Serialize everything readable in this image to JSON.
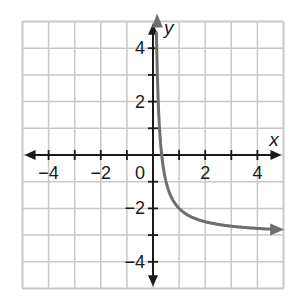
{
  "chart_data": {
    "type": "line",
    "title": "",
    "xlabel": "x",
    "ylabel": "y",
    "xlim": [
      -5,
      5
    ],
    "ylim": [
      -5,
      5
    ],
    "grid": true,
    "grid_step": 1,
    "x_ticks": [
      -4,
      -2,
      0,
      2,
      4
    ],
    "y_ticks": [
      4,
      2,
      -2,
      -4
    ],
    "x_tick_labels": [
      "−4",
      "−2",
      "0",
      "2",
      "4"
    ],
    "y_tick_labels": [
      "4",
      "2",
      "−2",
      "−4"
    ],
    "series": [
      {
        "name": "curve",
        "description": "decreasing curve with vertical asymptote x=0 and horizontal asymptote y=-3, arrows on both ends",
        "x": [
          0.18,
          0.2,
          0.25,
          0.3,
          0.33,
          0.4,
          0.5,
          0.75,
          1,
          1.5,
          2,
          3,
          4,
          5
        ],
        "values": [
          2.56,
          2.0,
          1.0,
          0.33,
          0.0,
          -0.5,
          -1.0,
          -1.67,
          -2.0,
          -2.33,
          -2.5,
          -2.67,
          -2.75,
          -2.8
        ],
        "color": "#6e6e6e"
      }
    ],
    "asymptotes": {
      "vertical_x": 0,
      "horizontal_y": -3
    }
  },
  "colors": {
    "grid": "#c8c8c8",
    "axis": "#1a1a1a",
    "curve": "#6e6e6e",
    "background": "#ffffff"
  }
}
